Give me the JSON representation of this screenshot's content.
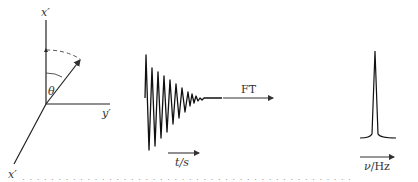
{
  "figure": {
    "frame": {
      "axes": {
        "z_label": "x′",
        "y_label": "y′",
        "x_label": "x′",
        "angle_label": "θ"
      }
    },
    "fid": {
      "axis_label": "t/s"
    },
    "transform": {
      "label": "FT"
    },
    "spectrum": {
      "axis_label": "ν/Hz"
    },
    "caption": "· · · · · · · · · · · · · · · · · · · · · · · · · · · · · · · · · · · · · · · · · · · · · ·"
  }
}
